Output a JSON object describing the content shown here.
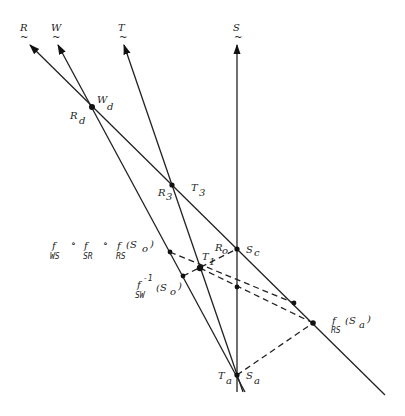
{
  "diagram": {
    "axes": [
      {
        "id": "R",
        "label": "R",
        "from": [
          385,
          395
        ],
        "to": [
          30,
          45
        ]
      },
      {
        "id": "W",
        "label": "W",
        "from": [
          245,
          392
        ],
        "to": [
          58,
          45
        ]
      },
      {
        "id": "T",
        "label": "T",
        "from": [
          243,
          392
        ],
        "to": [
          124,
          45
        ]
      },
      {
        "id": "S",
        "label": "S",
        "from": [
          237,
          392
        ],
        "to": [
          237,
          45
        ]
      }
    ],
    "axis_label_pos": {
      "R": [
        22,
        30
      ],
      "W": [
        52,
        30
      ],
      "T": [
        119,
        30
      ],
      "S": [
        233,
        30
      ]
    },
    "points": [
      {
        "id": "Wd",
        "x": 92,
        "y": 107
      },
      {
        "id": "R3",
        "x": 172,
        "y": 185
      },
      {
        "id": "Sc",
        "x": 237,
        "y": 249
      },
      {
        "id": "T1",
        "x": 200,
        "y": 268
      },
      {
        "id": "fWS_fSR_fRS",
        "x": 170,
        "y": 252
      },
      {
        "id": "fSW_inv",
        "x": 183,
        "y": 276
      },
      {
        "id": "S_mid",
        "x": 237,
        "y": 287
      },
      {
        "id": "R_mid",
        "x": 294,
        "y": 303
      },
      {
        "id": "fRS_Sa",
        "x": 313,
        "y": 323
      },
      {
        "id": "Ta_Sa",
        "x": 237,
        "y": 375
      }
    ],
    "dashed_segments": [
      {
        "from": [
          170,
          252
        ],
        "to": [
          294,
          303
        ]
      },
      {
        "from": [
          200,
          268
        ],
        "to": [
          313,
          323
        ]
      },
      {
        "from": [
          183,
          276
        ],
        "to": [
          237,
          249
        ]
      },
      {
        "from": [
          237,
          375
        ],
        "to": [
          313,
          323
        ]
      }
    ],
    "labels": {
      "R_d": {
        "main": "R",
        "sub": "d",
        "x": 70,
        "y": 119
      },
      "W_d": {
        "main": "W",
        "sub": "d",
        "x": 97,
        "y": 103
      },
      "R_3": {
        "main": "R",
        "sub": "3",
        "x": 158,
        "y": 197
      },
      "T_3": {
        "main": "T",
        "sub": "3",
        "x": 191,
        "y": 196
      },
      "T_1": {
        "main": "T",
        "sub": "1",
        "x": 203,
        "y": 262
      },
      "R_o": {
        "main": "R",
        "sub": "o",
        "x": 217,
        "y": 253
      },
      "S_c": {
        "main": "S",
        "sub": "c",
        "x": 247,
        "y": 253
      },
      "T_a": {
        "main": "T",
        "sub": "a",
        "x": 218,
        "y": 380
      },
      "S_a": {
        "main": "S",
        "sub": "a",
        "x": 246,
        "y": 380
      }
    },
    "compositions": {
      "composite": {
        "text": "f ∘ f ∘ f (S )",
        "parts": [
          "f",
          "∘",
          "f",
          "∘",
          "f",
          "(S",
          "o",
          ")"
        ],
        "subs": [
          "WS",
          "SR",
          "RS"
        ]
      },
      "inverse": {
        "f": "f",
        "sup": "-1",
        "arg": "(S",
        "arg_sub": "o",
        "close": ")",
        "sub": "SW"
      },
      "fRS_Sa": {
        "f": "f",
        "arg": "(S",
        "arg_sub": "a",
        "close": ")",
        "sub": "RS"
      }
    }
  }
}
